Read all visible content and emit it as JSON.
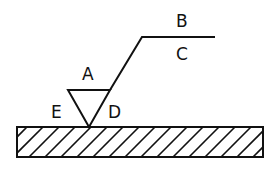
{
  "diagram": {
    "type": "surface-texture-symbol",
    "stroke_color": "#111111",
    "background": "#ffffff",
    "labels": {
      "a": "A",
      "b": "B",
      "c": "C",
      "d": "D",
      "e": "E"
    },
    "parts": [
      {
        "id": "surface",
        "description": "hatched workpiece surface"
      },
      {
        "id": "symbol",
        "description": "inverted triangle (V) touching surface"
      },
      {
        "id": "leader",
        "description": "extension line from symbol to horizontal bar"
      }
    ]
  }
}
